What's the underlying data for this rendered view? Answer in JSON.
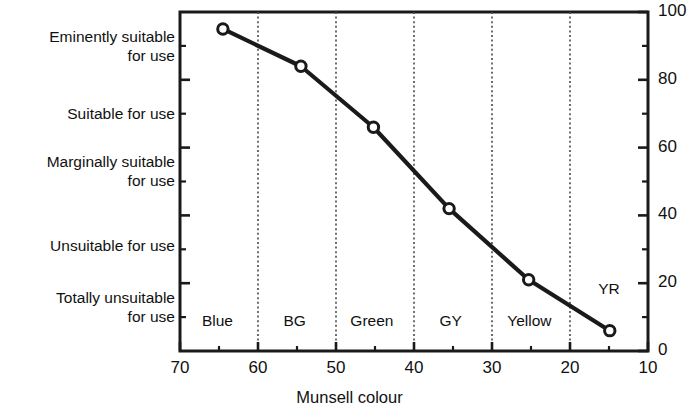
{
  "chart_data": {
    "type": "line",
    "title": "",
    "xlabel": "Munsell colour",
    "ylabel": "",
    "x": [
      64.5,
      54.5,
      45.2,
      35.5,
      25.3,
      14.9
    ],
    "values": [
      95,
      84,
      66,
      42,
      21,
      6
    ],
    "series": [
      {
        "name": "Suitability for use",
        "x": [
          64.5,
          54.5,
          45.2,
          35.5,
          25.3,
          14.9
        ],
        "values": [
          95,
          84,
          66,
          42,
          21,
          6
        ]
      }
    ],
    "xlim": [
      70,
      10
    ],
    "ylim": [
      0,
      100
    ],
    "x_ticks_major": [
      70,
      60,
      50,
      40,
      30,
      20,
      10
    ],
    "x_tick_labels": [
      "70",
      "60",
      "50",
      "40",
      "30",
      "20",
      "10"
    ],
    "x_ticks_minor": [
      65,
      55,
      45,
      35,
      25,
      15
    ],
    "y_ticks_major": [
      0,
      20,
      40,
      60,
      80,
      100
    ],
    "y_tick_labels": [
      "0",
      "20",
      "40",
      "60",
      "80",
      "100"
    ],
    "y_ticks_minor": [
      10,
      30,
      50,
      70,
      90
    ],
    "grid": "vertical-dotted-dividers",
    "gridlines_x": [
      60,
      50,
      40,
      30,
      20
    ],
    "legend": "none",
    "marker": "open-circle",
    "line_color": "#1a1a1a",
    "marker_fill": "#ffffff",
    "category_bands": [
      {
        "label": "Blue",
        "center": 65.2
      },
      {
        "label": "BG",
        "center": 55.3
      },
      {
        "label": "Green",
        "center": 45.4
      },
      {
        "label": "GY",
        "center": 35.3
      },
      {
        "label": "Yellow",
        "center": 25.2
      },
      {
        "label": "YR",
        "center": 15.0
      }
    ],
    "y_category_labels": [
      {
        "label": "Eminently suitable\nfor use",
        "value": 90
      },
      {
        "label": "Suitable for use",
        "value": 70
      },
      {
        "label": "Marginally suitable\nfor use",
        "value": 53
      },
      {
        "label": "Unsuitable for use",
        "value": 31
      },
      {
        "label": "Totally unsuitable\nfor use",
        "value": 13
      }
    ]
  },
  "axis": {
    "x_title": "Munsell colour"
  },
  "colors": {
    "line": "#1a1a1a",
    "text": "#111111",
    "frame": "#1a1a1a",
    "divider": "#4a4a4a"
  }
}
